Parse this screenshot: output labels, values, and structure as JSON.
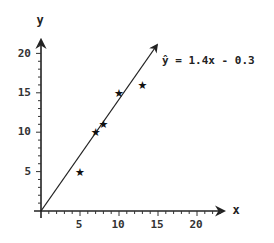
{
  "chart_data": {
    "type": "scatter",
    "title": "",
    "xlabel": "x",
    "ylabel": "y",
    "xlim": [
      0,
      22
    ],
    "ylim": [
      0,
      22
    ],
    "x_ticks": [
      5,
      10,
      15,
      20
    ],
    "y_ticks": [
      5,
      10,
      15,
      20
    ],
    "grid": false,
    "legend": null,
    "series": [
      {
        "name": "observations",
        "marker": "star",
        "points": [
          {
            "x": 5,
            "y": 5
          },
          {
            "x": 7,
            "y": 10
          },
          {
            "x": 8,
            "y": 11
          },
          {
            "x": 10,
            "y": 15
          },
          {
            "x": 13,
            "y": 16
          }
        ]
      },
      {
        "name": "regression line",
        "type": "line",
        "slope": 1.4,
        "intercept": -0.3,
        "x_range": [
          0,
          15.2
        ]
      }
    ],
    "annotations": [
      {
        "text": "ŷ = 1.4x - 0.3",
        "position": "upper right near line end"
      }
    ]
  },
  "labels": {
    "x_axis": "x",
    "y_axis": "y",
    "equation": "ŷ = 1.4x - 0.3",
    "x_ticks": [
      "5",
      "10",
      "15",
      "20"
    ],
    "y_ticks": [
      "5",
      "10",
      "15",
      "20"
    ]
  },
  "colors": {
    "axis": "#222222",
    "line": "#222222",
    "marker": "#111111",
    "text": "#333333"
  }
}
